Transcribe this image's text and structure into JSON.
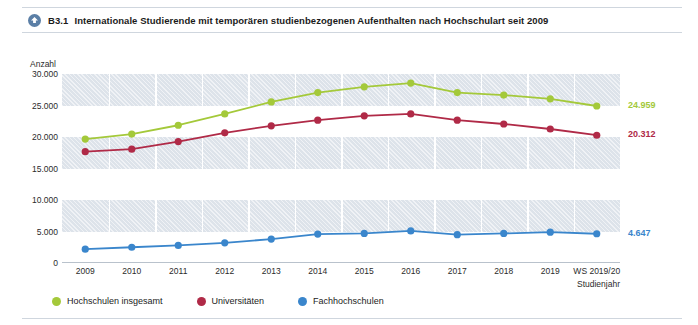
{
  "header": {
    "icon": "download-circle-icon",
    "figure_number": "B3.1",
    "title": "Internationale Studierende mit temporären studienbezogenen Aufenthalten nach Hochschulart seit 2009"
  },
  "colors": {
    "green": "#a4c93a",
    "red": "#b02a47",
    "blue": "#3a86cc",
    "band": "#dde3ea",
    "axis": "#b9c2cc",
    "text": "#1b1b1b"
  },
  "chart_data": {
    "type": "line",
    "title": "Internationale Studierende mit temporären studienbezogenen Aufenthalten nach Hochschulart seit 2009",
    "xlabel": "Studienjahr",
    "ylabel": "Anzahl",
    "ylim": [
      0,
      31000
    ],
    "yticks": [
      0,
      5000,
      10000,
      15000,
      20000,
      25000,
      30000
    ],
    "ytick_labels": [
      "0",
      "5.000",
      "10.000",
      "15.000",
      "20.000",
      "25.000",
      "30.000"
    ],
    "grid": "horizontal-bands",
    "legend_position": "bottom-left",
    "categories": [
      "2009",
      "2010",
      "2011",
      "2012",
      "2013",
      "2014",
      "2015",
      "2016",
      "2017",
      "2018",
      "2019",
      "WS 2019/20"
    ],
    "series": [
      {
        "name": "Hochschulen insgesamt",
        "color": "#a4c93a",
        "values": [
          19700,
          20500,
          21900,
          23700,
          25600,
          27100,
          28000,
          28600,
          27100,
          26700,
          26100,
          24959
        ],
        "end_label": "24.959"
      },
      {
        "name": "Universitäten",
        "color": "#b02a47",
        "values": [
          17700,
          18100,
          19300,
          20700,
          21800,
          22700,
          23400,
          23700,
          22700,
          22100,
          21300,
          20312
        ],
        "end_label": "20.312"
      },
      {
        "name": "Fachhochschulen",
        "color": "#3a86cc",
        "values": [
          2200,
          2500,
          2800,
          3200,
          3800,
          4600,
          4700,
          5100,
          4500,
          4700,
          4900,
          4647
        ],
        "end_label": "4.647"
      }
    ]
  },
  "legend": [
    {
      "label": "Hochschulen insgesamt",
      "color": "#a4c93a"
    },
    {
      "label": "Universitäten",
      "color": "#b02a47"
    },
    {
      "label": "Fachhochschulen",
      "color": "#3a86cc"
    }
  ]
}
